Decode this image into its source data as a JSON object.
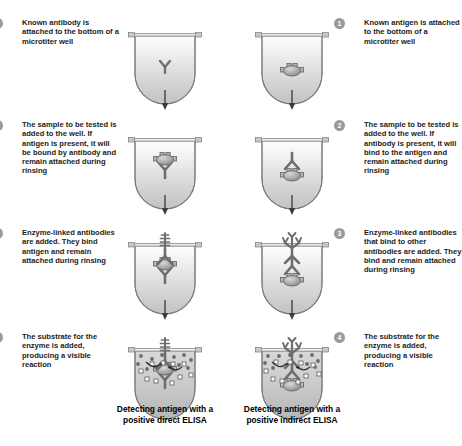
{
  "columns": {
    "left": {
      "name": "direct-elisa",
      "caption": "Detecting antigen with a positive direct ELISA",
      "caption_line1": "Detecting antigen with a",
      "caption_line2": "positive direct ELISA",
      "steps": [
        {
          "number": "1",
          "text": "Known antibody is attached to the bottom of a microtiter well",
          "lines": [
            "Known antibody is",
            "attached to the",
            "bottom of a",
            "microtiter well"
          ]
        },
        {
          "number": "2",
          "text": "The sample to be tested is added to the well. If antigen is present, it will be bound by antibody and remain attached during rinsing",
          "lines": [
            "The sample to be",
            "tested is added to",
            "the well. If antigen is",
            "present, it will be",
            "bound by antibody",
            "and remain attached",
            "during rinsing"
          ]
        },
        {
          "number": "3",
          "text": "Enzyme-linked antibodies are added. They bind antigen and remain attached during rinsing",
          "lines": [
            "Enzyme-linked",
            "antibodies are",
            "added. They bind",
            "antigen and",
            "remain attached",
            "during rinsing"
          ]
        },
        {
          "number": "4",
          "text": "The substrate for the enzyme is added, producing a visible reaction",
          "lines": [
            "The substrate",
            "for the enzyme",
            "is added, producing",
            "a visible reaction"
          ]
        }
      ]
    },
    "right": {
      "name": "indirect-elisa",
      "caption": "Detecting antigen with a positive indirect ELISA",
      "caption_line1": "Detecting antigen with a",
      "caption_line2": "positive indirect ELISA",
      "steps": [
        {
          "number": "1",
          "text": "Known antigen is attached to the bottom of a microtiter well",
          "lines": [
            "Known antigen is",
            "attached to the",
            "bottom of a",
            "microtiter well"
          ]
        },
        {
          "number": "2",
          "text": "The sample to be tested is added to the well. If antibody is present, it will bind to the antigen and remain attached during rinsing",
          "lines": [
            "The sample to be",
            "tested is added to",
            "the well. If antibody",
            "is present, it will",
            "bind to the antigen",
            "and remain attached",
            "during rinsing"
          ]
        },
        {
          "number": "3",
          "text": "Enzyme-linked antibodies that bind to other antibodies are added. They bind and remain attached during rinsing",
          "lines": [
            "Enzyme-linked",
            "antibodies that bind",
            "to other antibodies",
            "are added. They bind",
            "and remain attached",
            "during rinsing"
          ]
        },
        {
          "number": "4",
          "text": "The substrate for the enzyme is added, producing a visible reaction",
          "lines": [
            "The substrate",
            "for the enzyme is",
            "added, producing",
            "a visible reaction"
          ]
        }
      ]
    }
  },
  "colors": {
    "well_fill_top": "#fdfdfd",
    "well_fill_bottom": "#c9c9c9",
    "well_stroke": "#7d7d7d",
    "molecule": "#6e6e6e",
    "molecule_dark": "#5a5a5a",
    "badge_fill": "#9a9a9a",
    "badge_text": "#ffffff",
    "arrow": "#4a4a4a",
    "substrate_dot": "#6b6b6b",
    "product_square": "#ffffff",
    "text": "#1d1d1d"
  },
  "legend_shapes": {
    "antibody": "Y-shaped antibody",
    "antigen": "oval antigen with binding tabs",
    "enzyme": "ladder-shaped enzyme label",
    "substrate": "filled circle",
    "product": "open square",
    "reaction_arrow": "curved arrow"
  }
}
